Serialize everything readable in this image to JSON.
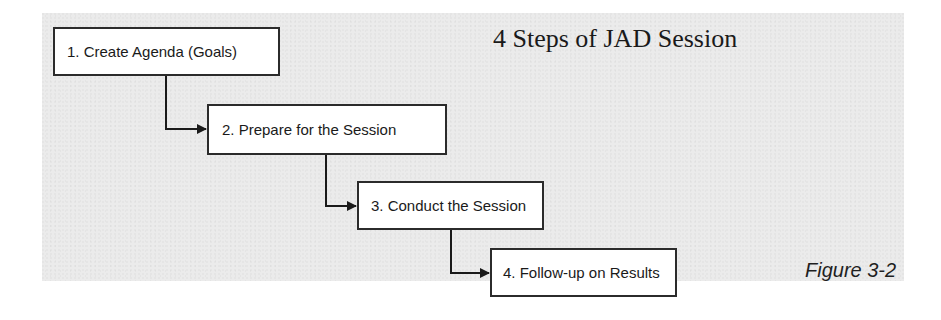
{
  "diagram": {
    "title": "4 Steps of JAD Session",
    "figure_label": "Figure 3-2",
    "steps": [
      {
        "label": "1. Create Agenda (Goals)"
      },
      {
        "label": "2. Prepare for the Session"
      },
      {
        "label": "3. Conduct the Session"
      },
      {
        "label": "4. Follow-up on Results"
      }
    ],
    "connectors": [
      {
        "from": "1. Create Agenda (Goals)",
        "to": "2. Prepare for the Session",
        "style": "elbow-arrow"
      },
      {
        "from": "2. Prepare for the Session",
        "to": "3. Conduct the Session",
        "style": "elbow-arrow"
      },
      {
        "from": "3. Conduct the Session",
        "to": "4. Follow-up on Results",
        "style": "elbow-arrow"
      }
    ],
    "colors": {
      "panel_background": "#ebebeb",
      "box_fill": "#ffffff",
      "box_border": "#2b2b2b",
      "text": "#1a1a1a"
    }
  }
}
